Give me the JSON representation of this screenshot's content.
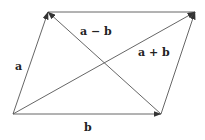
{
  "colors": {
    "line": "#555555",
    "text": "#222222",
    "background": "#ffffff"
  },
  "vertices": {
    "bottom_left": [
      13,
      114
    ],
    "bottom_right": [
      161,
      114
    ],
    "top_right": [
      195,
      12
    ],
    "top_left": [
      48,
      12
    ]
  },
  "vectors": [
    {
      "name": "a",
      "from": "bottom_left",
      "to": "top_left"
    },
    {
      "name": "b",
      "from": "bottom_left",
      "to": "bottom_right"
    },
    {
      "name": "a + b",
      "from": "bottom_left",
      "to": "top_right"
    },
    {
      "name": "a − b",
      "from": "bottom_right",
      "to": "top_left"
    },
    {
      "name": "a (translated)",
      "from": "bottom_right",
      "to": "top_right"
    }
  ],
  "labels": {
    "a": "a",
    "b": "b",
    "a_plus_b": "a + b",
    "a_minus_b": "a − b"
  }
}
